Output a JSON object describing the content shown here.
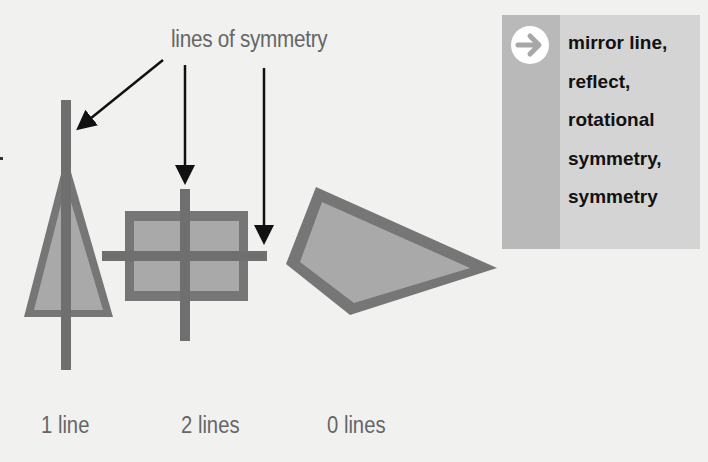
{
  "diagram": {
    "title": "lines of symmetry",
    "shapes": [
      {
        "name": "isosceles-triangle",
        "caption": "1 line",
        "lines_of_symmetry": 1
      },
      {
        "name": "rectangle",
        "caption": "2 lines",
        "lines_of_symmetry": 2
      },
      {
        "name": "irregular-quadrilateral",
        "caption": "0 lines",
        "lines_of_symmetry": 0
      }
    ],
    "colors": {
      "background": "#f1f1f0",
      "shape_outline": "#767676",
      "shape_fill": "#a9a9a9",
      "symmetry_line": "#6f6f6f",
      "arrow": "#111111",
      "text": "#666666"
    }
  },
  "keywords": {
    "icon": "arrow-right-circle-icon",
    "items": [
      "mirror line,",
      "reflect,",
      "rotational",
      "symmetry,",
      "symmetry"
    ],
    "colors": {
      "box": "#d4d4d4",
      "band": "#b9b9b9",
      "text": "#111111"
    }
  }
}
